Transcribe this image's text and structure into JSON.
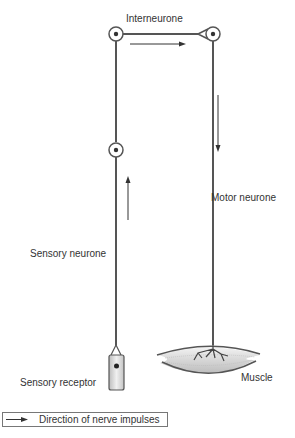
{
  "diagram": {
    "type": "reflex arc",
    "labels": {
      "interneurone": "Interneurone",
      "motor_neurone": "Motor neurone",
      "sensory_neurone": "Sensory neurone",
      "sensory_receptor": "Sensory receptor",
      "muscle": "Muscle"
    },
    "legend": {
      "text": "Direction of nerve impulses"
    },
    "colors": {
      "line": "#555555",
      "text": "#333333",
      "muscle_fill": "#d8d8d8",
      "receptor_fill": "#e4e4e4"
    }
  }
}
